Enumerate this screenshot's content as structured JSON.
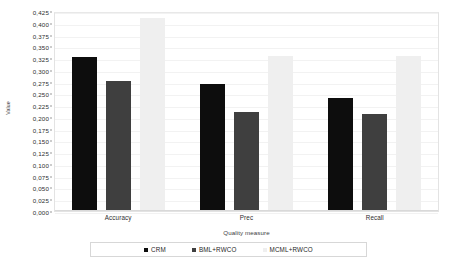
{
  "chart_data": {
    "type": "bar",
    "title": "",
    "xlabel": "Quality measure",
    "ylabel": "Value",
    "categories": [
      "Accuracy",
      "Prec",
      "Recall"
    ],
    "series": [
      {
        "name": "CRM",
        "color": "#0d0d0d",
        "values": [
          0.327,
          0.27,
          0.24
        ]
      },
      {
        "name": "BML+RWCO",
        "color": "#3f3f3f",
        "values": [
          0.277,
          0.21,
          0.207
        ]
      },
      {
        "name": "MCML+RWCO",
        "color": "#efefef",
        "values": [
          0.41,
          0.33,
          0.33
        ]
      }
    ],
    "ylim": [
      0.0,
      0.425
    ],
    "ytick_step": 0.025,
    "ytick_labels": [
      "0,000",
      "0,025",
      "0,050",
      "0,075",
      "0,100",
      "0,125",
      "0,150",
      "0,175",
      "0,200",
      "0,225",
      "0,250",
      "0,275",
      "0,300",
      "0,325",
      "0,350",
      "0,375",
      "0,400",
      "0,425"
    ],
    "ytick_values": [
      0.0,
      0.025,
      0.05,
      0.075,
      0.1,
      0.125,
      0.15,
      0.175,
      0.2,
      0.225,
      0.25,
      0.275,
      0.3,
      0.325,
      0.35,
      0.375,
      0.4,
      0.425
    ],
    "grid": true,
    "legend_position": "bottom"
  }
}
